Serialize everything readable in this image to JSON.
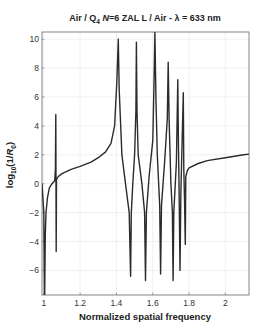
{
  "chart_data": {
    "type": "line",
    "title": "Air / Q4 N=6 ZAL L / Air - λ = 633 nm",
    "title_parts": {
      "pre": "Air / Q",
      "sub": "4",
      "mid": " N",
      "post": "=6 ZAL L / Air - λ = 633 nm"
    },
    "xlabel": "Normalized spatial frequency",
    "ylabel": "log10(1/R0)",
    "ylabel_parts": {
      "pre": "log",
      "sub1": "10",
      "mid": "(1/",
      "R": "R",
      "sub2": "0",
      "post": ")"
    },
    "xlim": [
      0.99,
      2.13
    ],
    "ylim": [
      -7.7,
      10.5
    ],
    "xticks": [
      1,
      1.2,
      1.4,
      1.6,
      1.8,
      2
    ],
    "xtick_labels": [
      "1",
      "1.2",
      "1.4",
      "1.6",
      "1.8",
      "2"
    ],
    "yticks": [
      -6,
      -4,
      -2,
      0,
      2,
      4,
      6,
      8,
      10
    ],
    "ytick_labels": [
      "−6",
      "−4",
      "−2",
      "0",
      "2",
      "4",
      "6",
      "8",
      "10"
    ],
    "grid": true,
    "line_color": "#2b2b2b",
    "series": [
      {
        "name": "log10(1/R0)",
        "x": [
          0.99,
          1.0,
          1.003,
          1.005,
          1.008,
          1.012,
          1.02,
          1.03,
          1.045,
          1.06,
          1.064,
          1.066,
          1.068,
          1.07,
          1.08,
          1.1,
          1.15,
          1.2,
          1.26,
          1.3,
          1.34,
          1.37,
          1.39,
          1.402,
          1.41,
          1.415,
          1.43,
          1.45,
          1.47,
          1.478,
          1.482,
          1.49,
          1.5,
          1.507,
          1.51,
          1.513,
          1.52,
          1.54,
          1.555,
          1.56,
          1.565,
          1.58,
          1.6,
          1.607,
          1.612,
          1.617,
          1.625,
          1.638,
          1.643,
          1.648,
          1.665,
          1.68,
          1.685,
          1.69,
          1.7,
          1.708,
          1.712,
          1.716,
          1.73,
          1.738,
          1.741,
          1.745,
          1.75,
          1.755,
          1.76,
          1.768,
          1.771,
          1.775,
          1.779,
          1.782,
          1.79,
          1.8,
          1.85,
          1.9,
          2.0,
          2.1,
          2.13
        ],
        "y": [
          0.0,
          -2.0,
          -7.7,
          -7.7,
          -3.5,
          -2.0,
          -1.0,
          -0.3,
          0.0,
          0.2,
          1.0,
          4.8,
          -4.7,
          0.3,
          0.5,
          0.7,
          1.0,
          1.2,
          1.5,
          1.8,
          2.2,
          2.8,
          4.0,
          7.0,
          10.0,
          6.5,
          2.0,
          0.0,
          -2.0,
          -6.4,
          -2.0,
          0.0,
          2.0,
          5.0,
          9.8,
          5.0,
          2.0,
          0.0,
          -2.0,
          -6.7,
          -2.0,
          0.5,
          3.0,
          7.0,
          10.5,
          6.0,
          2.0,
          -1.5,
          -6.25,
          -1.5,
          1.5,
          4.5,
          8.4,
          4.5,
          0.0,
          -2.0,
          -6.7,
          -2.0,
          1.5,
          7.2,
          3.0,
          -0.5,
          -6.0,
          -0.5,
          2.0,
          6.3,
          1.0,
          -1.0,
          -4.2,
          0.5,
          0.9,
          1.1,
          1.4,
          1.6,
          1.8,
          2.0,
          2.05
        ]
      }
    ],
    "legend": null
  }
}
